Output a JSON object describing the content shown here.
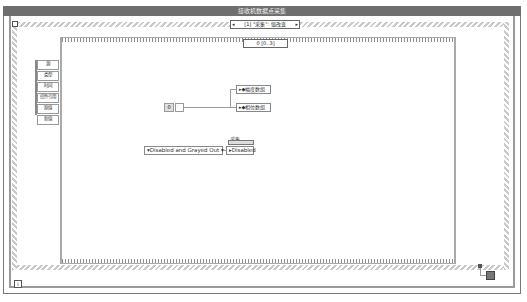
{
  "window": {
    "title": "接收机数据点采集"
  },
  "event_structure": {
    "selector_index": "[1]",
    "selector_label": "[1] \"采集\": 值改变",
    "prev_arrow": "◂",
    "next_arrow": "▸"
  },
  "event_data_node": {
    "items": [
      "源",
      "类型",
      "时间",
      "控件引用",
      "原值",
      "新值"
    ]
  },
  "sequence": {
    "selector_label": "0 [0..3]"
  },
  "diagram": {
    "numeric_constant": "0",
    "property_nodes": [
      {
        "label": "▸◆幅度数组"
      },
      {
        "label": "▸◆相位数组"
      }
    ],
    "enum_constant": "▾Disabled and Grayed Out ▾",
    "control_label": "采集",
    "disabled_property": "▸Disabled"
  },
  "loop": {
    "iteration_label": "i"
  },
  "colors": {
    "title_bar": "#6e6e6e",
    "frame_border": "#9a9a9a",
    "wire": "#9a9a9a"
  }
}
